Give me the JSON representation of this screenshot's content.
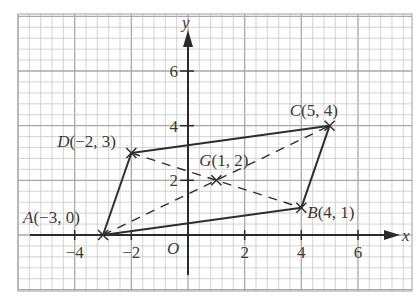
{
  "diagram": {
    "title": "",
    "grid": {
      "left": 18,
      "top": 14,
      "right": 412,
      "bottom": 291,
      "minor_step_x": 11.33,
      "minor_step_y": 10.93,
      "minor_color": "#c8c8c8",
      "major_color": "#a8a8a8",
      "border_color": "#b0b0b0"
    },
    "axes": {
      "origin_px": [
        188,
        235
      ],
      "unit_x_px": 28.33,
      "unit_y_px": 27.33,
      "x_label": "x",
      "y_label": "y",
      "origin_label": "O",
      "x_ticks": [
        {
          "value": -4,
          "label": "−4"
        },
        {
          "value": -2,
          "label": "−2"
        },
        {
          "value": 2,
          "label": "2"
        },
        {
          "value": 4,
          "label": "4"
        },
        {
          "value": 6,
          "label": "6"
        }
      ],
      "y_ticks": [
        {
          "value": 2,
          "label": "2"
        },
        {
          "value": 4,
          "label": "4"
        },
        {
          "value": 6,
          "label": "6"
        }
      ],
      "color": "#2a2a2a"
    },
    "points": [
      {
        "name": "A",
        "coords": "(−3, 0)",
        "x": -3,
        "y": 0
      },
      {
        "name": "B",
        "coords": "(4, 1)",
        "x": 4,
        "y": 1
      },
      {
        "name": "C",
        "coords": "(5, 4)",
        "x": 5,
        "y": 4
      },
      {
        "name": "D",
        "coords": "(−2, 3)",
        "x": -2,
        "y": 3
      },
      {
        "name": "G",
        "coords": "(1, 2)",
        "x": 1,
        "y": 2
      }
    ],
    "solid_edges": [
      [
        "A",
        "B"
      ],
      [
        "B",
        "C"
      ],
      [
        "C",
        "D"
      ],
      [
        "D",
        "A"
      ]
    ],
    "dashed_edges": [
      [
        "A",
        "C"
      ],
      [
        "D",
        "B"
      ]
    ],
    "line_color": "#2e2e2e"
  }
}
